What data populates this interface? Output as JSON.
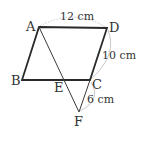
{
  "diagram": {
    "type": "geometry",
    "shape": "parallelogram ABCD with line AF intersecting BC at E and extension of DC to F",
    "colors": {
      "edge": "#2a2a2a",
      "thin_edge": "#3a3a3a",
      "measure_arc": "#c8c8c8",
      "text": "#333333"
    },
    "points": {
      "A": {
        "label": "A",
        "x": 39,
        "y": 27
      },
      "B": {
        "label": "B",
        "x": 22,
        "y": 80
      },
      "C": {
        "label": "C",
        "x": 90,
        "y": 80
      },
      "D": {
        "label": "D",
        "x": 107,
        "y": 28
      },
      "E": {
        "label": "E",
        "x": 65,
        "y": 80
      },
      "F": {
        "label": "F",
        "x": 79,
        "y": 112
      }
    },
    "measurements": {
      "AD": "12 cm",
      "DC": "10 cm",
      "CF": "6 cm"
    }
  }
}
